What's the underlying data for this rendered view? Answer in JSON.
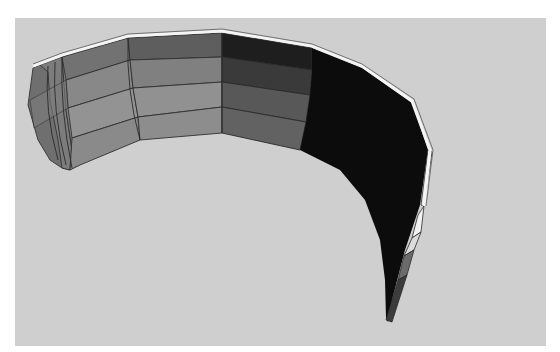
{
  "scene": {
    "description": "3D rendered curved band mesh on gray viewport",
    "colors": {
      "background": "#ffffff",
      "viewport": "#cfcfcf",
      "rim_highlight": "#f4f4f4",
      "edge_line": "#3a3a3a",
      "face_light": "#8e8e8e",
      "face_mid": "#7a7a7a",
      "face_dark": "#5a5a5a",
      "face_darker": "#3e3e3e",
      "face_black": "#0c0c0c"
    },
    "mesh": {
      "rows": 4,
      "segments_visible": 12
    }
  }
}
